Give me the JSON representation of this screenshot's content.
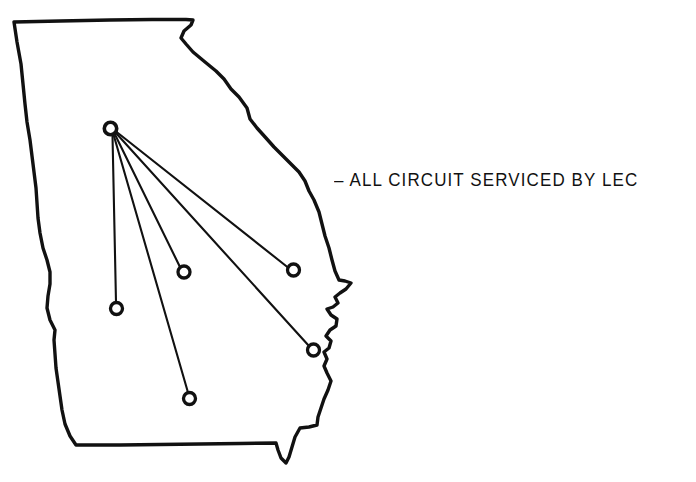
{
  "figure": {
    "kind": "network-map",
    "background_color": "#ffffff",
    "line_color": "#111111"
  },
  "annotation": {
    "text": "– ALL CIRCUIT SERVICED BY LEC",
    "dash_prefix": "–",
    "body": "ALL CIRCUIT SERVICED BY LEC"
  },
  "map": {
    "name": "state-outline-georgia",
    "stroke_color": "#111111",
    "stroke_width": 3.4,
    "fill": "none",
    "outline_path": "M 14 22 L 60 21 L 110 20 L 152 19.5 L 186 19.5 L 193 20 L 191 25 L 184 31 L 181 38 L 186 44 L 193 52 L 205 62 L 216 71 L 224 79 L 231 89 L 239 97 L 247 108 L 250 119 L 257 128 L 266 138 L 274 147 L 283 156 L 292 165 L 299 172 L 305 181 L 309 191 L 314 200 L 319 212 L 322 224 L 325 236 L 329 248 L 332 260 L 335 271 L 339 280 L 345 281 L 351 283 L 346 289 L 340 293 L 335 297 L 338 303 L 333 307 L 327 309 L 331 315 L 337 319 L 336 326 L 330 330 L 326 336 L 331 341 L 329 348 L 324 352 L 327 359 L 324 366 L 327 373 L 331 381 L 328 390 L 324 399 L 321 408 L 318 417 L 317 425 L 309 427 L 300 428 L 295 437 L 292 447 L 289 457 L 286 463 L 281 458 L 278 450 L 276 443 L 240 443.5 L 200 444 L 160 444.5 L 120 445 L 90 445 L 76 445 L 70 436 L 65 424 L 62 410 L 60 396 L 58 382 L 56 368 L 55 354 L 54 340 L 55 330 L 50 320 L 47 308 L 48 296 L 50 284 L 50 272 L 47 260 L 43 248 L 40 233 L 38 218 L 37 203 L 36 188 L 34 172 L 32 156 L 30 140 L 27 122 L 25 104 L 23 84 L 21 64 L 17 42 L 14 22 Z"
  },
  "hub": {
    "name": "hub-node",
    "label": "",
    "x": 110.5,
    "y": 128.5,
    "radius": 6.2
  },
  "nodes": [
    {
      "name": "node-west",
      "x": 116.5,
      "y": 308.5,
      "radius": 6.0
    },
    {
      "name": "node-south",
      "x": 189.5,
      "y": 398.5,
      "radius": 6.0
    },
    {
      "name": "node-central",
      "x": 184.0,
      "y": 272.0,
      "radius": 6.0
    },
    {
      "name": "node-east",
      "x": 293.5,
      "y": 270.0,
      "radius": 6.0
    },
    {
      "name": "node-southeast",
      "x": 313.5,
      "y": 350.0,
      "radius": 6.0
    }
  ],
  "routes": [
    {
      "name": "route-hub-to-west",
      "from": "hub",
      "to": "node-west",
      "x1": 112.5,
      "y1": 135.0,
      "x2": 116.0,
      "y2": 302.0
    },
    {
      "name": "route-hub-to-south",
      "from": "hub",
      "to": "node-south",
      "x1": 113.5,
      "y1": 134.5,
      "x2": 188.0,
      "y2": 392.5
    },
    {
      "name": "route-hub-to-central",
      "from": "hub",
      "to": "node-central",
      "x1": 114.5,
      "y1": 133.5,
      "x2": 180.0,
      "y2": 267.0
    },
    {
      "name": "route-hub-to-southeast",
      "from": "hub",
      "to": "node-southeast",
      "x1": 115.5,
      "y1": 132.5,
      "x2": 309.0,
      "y2": 346.0
    },
    {
      "name": "route-hub-to-east",
      "from": "hub",
      "to": "node-east",
      "x1": 116.0,
      "y1": 131.5,
      "x2": 288.0,
      "y2": 267.5
    }
  ]
}
